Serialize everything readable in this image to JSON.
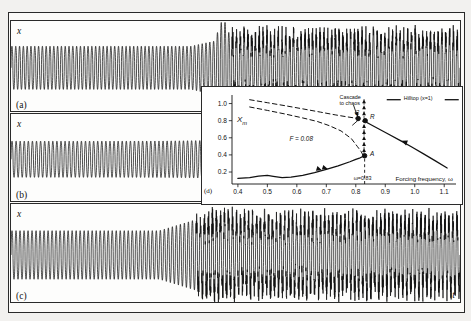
{
  "figure": {
    "panels": [
      {
        "id": "a",
        "label": "(a)",
        "ylabel": "x",
        "xlabel": "t"
      },
      {
        "id": "b",
        "label": "(b)",
        "ylabel": "x",
        "xlabel": "t"
      },
      {
        "id": "c",
        "label": "(c)",
        "ylabel": "x",
        "xlabel": "t"
      }
    ]
  },
  "ghost_text": [
    {
      "t": "the spring",
      "x": 60,
      "y": 28,
      "s": 7
    },
    {
      "t": "of chaotic",
      "x": 150,
      "y": 92,
      "s": 10
    },
    {
      "t": "and A lies",
      "x": 150,
      "y": 108,
      "s": 10
    },
    {
      "t": "in",
      "x": 60,
      "y": 124,
      "s": 10
    },
    {
      "t": "conditions",
      "x": 95,
      "y": 238,
      "s": 10
    },
    {
      "t": "with  values  of",
      "x": 60,
      "y": 252,
      "s": 10
    },
    {
      "t": "R  the  large",
      "x": 40,
      "y": 288,
      "s": 10
    },
    {
      "t": "is  given  by",
      "x": 250,
      "y": 288,
      "s": 10
    }
  ],
  "inset": {
    "panel_label": "(d)",
    "ylabel": "X",
    "ylabel_sub": "m",
    "xlabel": "Forcing frequency, ω",
    "yticks": [
      "1.0",
      "0.8",
      "0.6",
      "0.4",
      "0.2"
    ],
    "xticks": [
      "0.4",
      "0.5",
      "0.6",
      "0.7",
      "0.8",
      "0.9",
      "1.0",
      "1.1"
    ],
    "force_label": "F = 0.08",
    "cascade_label_line1": "Cascade",
    "cascade_label_line2": "to chaos",
    "legend_label": "Hilltop (x=1)",
    "omega_marker": "ω=0.83",
    "points": [
      {
        "name": "A",
        "label": "A",
        "x": 0.83,
        "y": 0.39
      },
      {
        "name": "C",
        "label": "C",
        "x": 0.808,
        "y": 0.825
      },
      {
        "name": "R",
        "label": "R",
        "x": 0.832,
        "y": 0.8
      }
    ],
    "axis": {
      "xlim": [
        0.38,
        1.14
      ],
      "ylim": [
        0.06,
        1.1
      ],
      "grid": false
    }
  },
  "chart_data": {
    "type": "line",
    "title": "",
    "xlabel": "Forcing frequency, ω",
    "ylabel": "Xm",
    "xlim": [
      0.38,
      1.14
    ],
    "ylim": [
      0.06,
      1.1
    ],
    "xticks": [
      0.4,
      0.5,
      0.6,
      0.7,
      0.8,
      0.9,
      1.0,
      1.1
    ],
    "yticks": [
      0.2,
      0.4,
      0.6,
      0.8,
      1.0
    ],
    "grid": false,
    "legend": [
      "Hilltop (x=1)"
    ],
    "legend_position": "top-right",
    "annotations": [
      {
        "text": "F = 0.08",
        "x": 0.62,
        "y": 0.57
      },
      {
        "text": "Cascade to chaos",
        "x": 0.79,
        "y": 1.04
      },
      {
        "text": "ω=0.83",
        "x": 0.83,
        "y": 0.1
      },
      {
        "text": "A",
        "x": 0.845,
        "y": 0.39
      },
      {
        "text": "C",
        "x": 0.8,
        "y": 0.855
      },
      {
        "text": "R",
        "x": 0.845,
        "y": 0.82
      }
    ],
    "series": [
      {
        "name": "lower stable branch",
        "style": "solid",
        "x": [
          0.4,
          0.44,
          0.47,
          0.5,
          0.52,
          0.55,
          0.58,
          0.62,
          0.66,
          0.7,
          0.74,
          0.78,
          0.8,
          0.815,
          0.825,
          0.83
        ],
        "y": [
          0.125,
          0.135,
          0.152,
          0.16,
          0.15,
          0.134,
          0.14,
          0.16,
          0.193,
          0.23,
          0.272,
          0.32,
          0.348,
          0.366,
          0.383,
          0.39
        ]
      },
      {
        "name": "upper stable branch",
        "style": "solid",
        "x": [
          0.826,
          0.85,
          0.88,
          0.91,
          0.95,
          0.99,
          1.03,
          1.07,
          1.11
        ],
        "y": [
          0.8,
          0.756,
          0.7,
          0.645,
          0.57,
          0.492,
          0.412,
          0.33,
          0.247
        ]
      },
      {
        "name": "unstable branch upper (dashed)",
        "style": "dashed",
        "x": [
          0.44,
          0.5,
          0.56,
          0.62,
          0.68,
          0.73,
          0.77,
          0.795,
          0.808
        ],
        "y": [
          1.045,
          1.01,
          0.975,
          0.938,
          0.9,
          0.868,
          0.845,
          0.832,
          0.825
        ]
      },
      {
        "name": "unstable branch lower (dashed)",
        "style": "dashed",
        "x": [
          0.44,
          0.5,
          0.56,
          0.62,
          0.67,
          0.71,
          0.75,
          0.785,
          0.805,
          0.818,
          0.824
        ],
        "y": [
          0.96,
          0.92,
          0.878,
          0.832,
          0.79,
          0.742,
          0.68,
          0.59,
          0.5,
          0.44,
          0.4
        ]
      }
    ],
    "cascade_markers": {
      "x": 0.828,
      "y": [
        0.45,
        0.52,
        0.59,
        0.66,
        0.73,
        0.8,
        0.88,
        0.95,
        1.02
      ],
      "marker": "triangle-up"
    }
  }
}
